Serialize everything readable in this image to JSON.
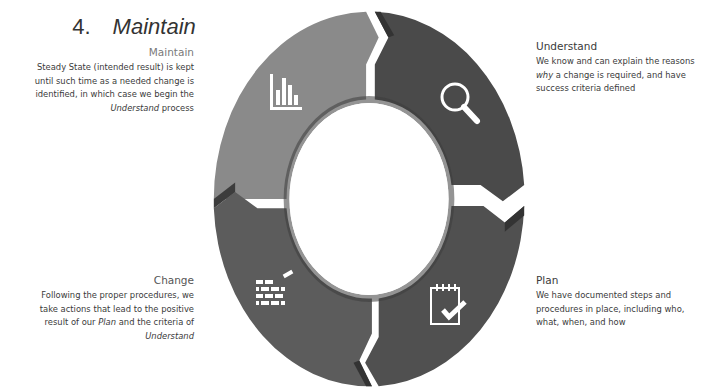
{
  "heading": {
    "number": "4.",
    "title": "Maintain"
  },
  "cycle": {
    "colors": {
      "maintain": "#8a8a8a",
      "understand": "#4a4a4a",
      "plan": "#505050",
      "change": "#5c5c5c",
      "edge_shadow": "#3a3a3a",
      "icon": "#ffffff"
    },
    "stages": [
      {
        "key": "maintain",
        "title": "Maintain",
        "icon": "bar-chart-icon",
        "body_lines": [
          "Steady State (intended result) is kept",
          "until such time as a needed change is",
          "identified, in which case we begin the"
        ],
        "body_italic_word": "Understand",
        "body_tail": " process"
      },
      {
        "key": "understand",
        "title": "Understand",
        "icon": "magnifier-icon",
        "body_line1": "We know and can explain the reasons",
        "body_italic_word": "why",
        "body_line2_rest": " a change is required, and have",
        "body_line3": "success criteria defined"
      },
      {
        "key": "plan",
        "title": "Plan",
        "icon": "notepad-check-icon",
        "body_lines": [
          "We have documented steps and",
          "procedures in place, including who,",
          "what, when, and how"
        ]
      },
      {
        "key": "change",
        "title": "Change",
        "icon": "brick-wall-icon",
        "body_line1": "Following the proper procedures, we",
        "body_line2": "take actions that lead to the positive",
        "body_line3_pre": "result of our ",
        "body_line3_italic": "Plan",
        "body_line3_post": " and the criteria of",
        "body_line4_italic": "Understand"
      }
    ]
  }
}
